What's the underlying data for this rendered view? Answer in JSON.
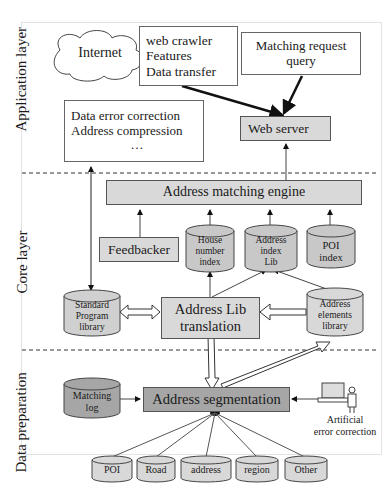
{
  "layers": {
    "application": "Application layer",
    "core": "Core layer",
    "data_prep": "Data preparation"
  },
  "application_layer": {
    "internet": "Internet",
    "crawler_box": [
      "web crawler",
      "Features",
      "Data transfer"
    ],
    "matching_request": [
      "Matching request",
      "query"
    ],
    "data_error_box": [
      "Data error correction",
      "Address compression",
      "…"
    ],
    "web_server": "Web server"
  },
  "core_layer": {
    "matching_engine": "Address matching engine",
    "feedbacker": "Feedbacker",
    "house_number_index": [
      "House",
      "number",
      "index"
    ],
    "address_index_lib": [
      "Address",
      "index",
      "Lib"
    ],
    "poi_index": [
      "POI",
      "index"
    ],
    "standard_program_library": [
      "Standard",
      "Program",
      "library"
    ],
    "address_lib_translation": [
      "Address Lib",
      "translation"
    ],
    "address_elements_library": [
      "Address",
      "elements",
      "library"
    ]
  },
  "data_preparation": {
    "matching_log": [
      "Matching",
      "log"
    ],
    "address_segmentation": "Address segmentation",
    "artificial_error_correction": [
      "Artificial",
      "error correction"
    ],
    "sources": [
      "POI",
      "Road",
      "address",
      "region",
      "Other"
    ]
  },
  "colors": {
    "light_gray": "#d9d9d9",
    "dark_gray": "#a6a6a6",
    "cylinder_gray": "#c8c8c8",
    "line": "#555555"
  }
}
